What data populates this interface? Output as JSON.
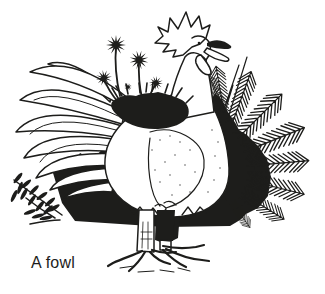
{
  "caption": {
    "text": "A fowl"
  },
  "colors": {
    "ink": "#1d1d1b",
    "paper": "#ffffff"
  }
}
